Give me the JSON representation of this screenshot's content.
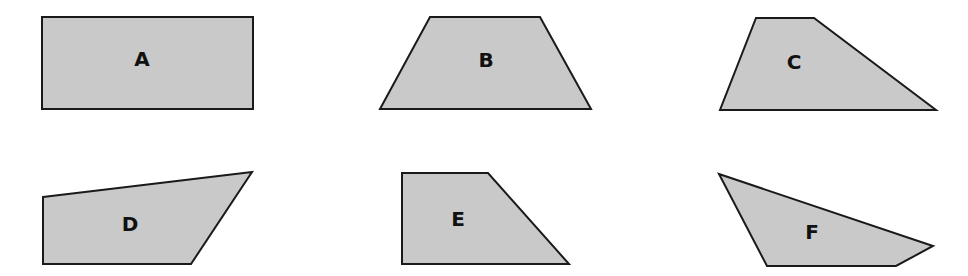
{
  "figure": {
    "width": 968,
    "height": 276,
    "fill_color": "#c9c9c9",
    "stroke_color": "#1a1a1a",
    "shapes": [
      {
        "label": "A",
        "type": "rectangle",
        "points": "42,17 253,17 253,109 42,109",
        "label_x": 142,
        "label_y": 60
      },
      {
        "label": "B",
        "type": "trapezoid",
        "points": "430,17 540,17 591,109 380,109",
        "label_x": 486,
        "label_y": 61
      },
      {
        "label": "C",
        "type": "trapezoid",
        "points": "756,18 814,18 936,110 720,110",
        "label_x": 794,
        "label_y": 63
      },
      {
        "label": "D",
        "type": "quadrilateral",
        "points": "43,197 252,172 191,264 43,264",
        "label_x": 130,
        "label_y": 225
      },
      {
        "label": "E",
        "type": "right-trapezoid",
        "points": "402,173 488,173 569,264 402,264",
        "label_x": 458,
        "label_y": 220
      },
      {
        "label": "F",
        "type": "quadrilateral",
        "points": "719,174 933,246 896,266 767,266",
        "label_x": 812,
        "label_y": 233
      }
    ]
  }
}
